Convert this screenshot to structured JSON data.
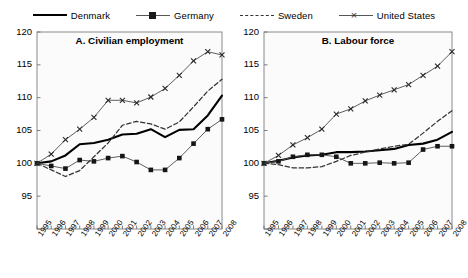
{
  "legend": {
    "items": [
      {
        "label": "Denmark",
        "key": "solid-line-key",
        "style": "solid"
      },
      {
        "label": "Germany",
        "key": "square-marker-line-key",
        "style": "square"
      },
      {
        "label": "Sweden",
        "key": "dashed-line-key",
        "style": "dashed"
      },
      {
        "label": "United States",
        "key": "cross-marker-line-key",
        "style": "cross"
      }
    ]
  },
  "chart_data": [
    {
      "type": "line",
      "title": "A. Civilian employment",
      "xlabel": "",
      "ylabel": "",
      "ylim": [
        90,
        120
      ],
      "yticks": [
        90,
        95,
        100,
        105,
        110,
        115,
        120
      ],
      "ytick_labels": [
        "90",
        "95",
        "100",
        "105",
        "110",
        "115",
        "120"
      ],
      "grid": false,
      "legend_position": "top-center-shared",
      "x": [
        1995,
        1996,
        1997,
        1998,
        1999,
        2000,
        2001,
        2002,
        2003,
        2004,
        2005,
        2006,
        2007,
        2008
      ],
      "categories": [
        "1995",
        "1996",
        "1997",
        "1998",
        "1999",
        "2000",
        "2001",
        "2002",
        "2003",
        "2004",
        "2005",
        "2006",
        "2007",
        "2008"
      ],
      "series": [
        {
          "name": "Denmark",
          "style": "solid",
          "marker": "none",
          "values": [
            100.0,
            100.3,
            101.2,
            102.9,
            103.1,
            103.6,
            104.4,
            104.5,
            105.2,
            104.0,
            105.1,
            105.2,
            107.3,
            110.3
          ]
        },
        {
          "name": "Germany",
          "style": "solid-thin",
          "marker": "square",
          "values": [
            100.0,
            99.6,
            99.2,
            100.5,
            100.3,
            100.8,
            101.1,
            100.2,
            99.0,
            99.0,
            100.8,
            103.0,
            105.2,
            106.7
          ]
        },
        {
          "name": "Sweden",
          "style": "dashed",
          "marker": "none",
          "values": [
            100.0,
            99.0,
            98.0,
            98.9,
            101.0,
            103.1,
            105.8,
            106.4,
            106.0,
            105.2,
            106.3,
            108.6,
            111.0,
            112.8
          ]
        },
        {
          "name": "United States",
          "style": "solid-thin",
          "marker": "cross",
          "values": [
            100.0,
            101.4,
            103.6,
            105.2,
            107.0,
            109.6,
            109.6,
            109.2,
            110.1,
            111.4,
            113.4,
            115.6,
            117.0,
            116.5
          ]
        }
      ]
    },
    {
      "type": "line",
      "title": "B. Labour force",
      "xlabel": "",
      "ylabel": "",
      "ylim": [
        90,
        120
      ],
      "yticks": [
        90,
        95,
        100,
        105,
        110,
        115,
        120
      ],
      "ytick_labels": [
        "90",
        "95",
        "100",
        "105",
        "110",
        "115",
        "120"
      ],
      "grid": false,
      "legend_position": "top-center-shared",
      "x": [
        1995,
        1996,
        1997,
        1998,
        1999,
        2000,
        2001,
        2002,
        2003,
        2004,
        2005,
        2006,
        2007,
        2008
      ],
      "categories": [
        "1995",
        "1996",
        "1997",
        "1998",
        "1999",
        "2000",
        "2001",
        "2002",
        "2003",
        "2004",
        "2005",
        "2006",
        "2007",
        "2008"
      ],
      "series": [
        {
          "name": "Denmark",
          "style": "solid",
          "marker": "none",
          "values": [
            100.0,
            100.4,
            100.9,
            101.2,
            101.3,
            101.7,
            101.7,
            101.8,
            102.0,
            102.2,
            102.8,
            103.0,
            103.6,
            104.8
          ]
        },
        {
          "name": "Germany",
          "style": "solid-thin",
          "marker": "square",
          "values": [
            100.0,
            100.3,
            101.0,
            101.3,
            101.3,
            101.0,
            100.0,
            100.0,
            100.1,
            100.0,
            100.1,
            102.1,
            102.6,
            102.6
          ]
        },
        {
          "name": "Sweden",
          "style": "dashed",
          "marker": "none",
          "values": [
            100.0,
            99.8,
            99.3,
            99.3,
            99.5,
            100.3,
            101.2,
            101.7,
            102.2,
            102.6,
            102.9,
            104.6,
            106.4,
            108.0
          ]
        },
        {
          "name": "United States",
          "style": "solid-thin",
          "marker": "cross",
          "values": [
            100.0,
            101.2,
            102.8,
            103.9,
            105.2,
            107.5,
            108.3,
            109.5,
            110.4,
            111.2,
            112.0,
            113.4,
            114.8,
            117.0
          ]
        }
      ]
    }
  ]
}
